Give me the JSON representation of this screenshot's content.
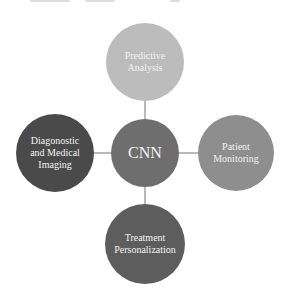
{
  "diagram": {
    "type": "hub-and-spoke",
    "center": {
      "label": "CNN",
      "color": "#6e6e6e"
    },
    "nodes": [
      {
        "id": "top",
        "label": "Predictive Analysis",
        "line1": "Predictive",
        "line2": "Analysis",
        "line3": "",
        "color": "#bcbcbc"
      },
      {
        "id": "left",
        "label": "Diagonostic and Medical Imaging",
        "line1": "Diagonostic",
        "line2": "and Medical",
        "line3": "Imaging",
        "color": "#4a4a4a"
      },
      {
        "id": "right",
        "label": "Patient Monitoring",
        "line1": "Patient",
        "line2": "Monitoring",
        "line3": "",
        "color": "#8e8e8e"
      },
      {
        "id": "bottom",
        "label": "Treatment Personalization",
        "line1": "Treatment",
        "line2": "Personalization",
        "line3": "",
        "color": "#5d5d5d"
      }
    ],
    "connector_color": "#8a8a8a"
  }
}
